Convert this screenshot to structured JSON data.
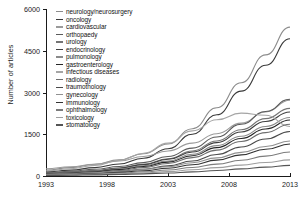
{
  "chart": {
    "type": "line",
    "title": "",
    "xlabel": "",
    "ylabel": "Number of articles",
    "xlim": [
      1993,
      2013
    ],
    "ylim": [
      0,
      6000
    ],
    "yticks": [
      0,
      1500,
      3000,
      4500,
      6000
    ],
    "ytick_labels": [
      "0",
      "1500",
      "3000",
      "4500",
      "6000"
    ],
    "xticks": [
      1993,
      1998,
      2003,
      2008,
      2013
    ],
    "xtick_labels": [
      "1993",
      "1998",
      "2003",
      "2008",
      "2013"
    ],
    "grid": false,
    "legend_position": "upper-left-inside"
  },
  "chart_data": {
    "type": "line",
    "title": "",
    "xlabel": "",
    "ylabel": "Number of articles",
    "xlim": [
      1993,
      2013
    ],
    "ylim": [
      0,
      6000
    ],
    "yticks": [
      0,
      1500,
      3000,
      4500,
      6000
    ],
    "xticks": [
      1993,
      1998,
      2003,
      2008,
      2013
    ],
    "grid": false,
    "legend_position": "upper-left-inside",
    "x": [
      1993,
      1995,
      1997,
      1999,
      2001,
      2003,
      2005,
      2007,
      2009,
      2011,
      2013
    ],
    "series": [
      {
        "name": "neurology/neurosurgery",
        "color": "#8c8c8c",
        "values": [
          210,
          300,
          420,
          580,
          800,
          1150,
          1700,
          2450,
          3350,
          4350,
          5350
        ]
      },
      {
        "name": "oncology",
        "color": "#3a3a3a",
        "values": [
          150,
          210,
          300,
          430,
          640,
          980,
          1500,
          2200,
          3050,
          3980,
          4930
        ]
      },
      {
        "name": "cardiovascular",
        "color": "#9a9a9a",
        "values": [
          260,
          330,
          420,
          540,
          700,
          900,
          1180,
          1520,
          1900,
          2300,
          2720
        ]
      },
      {
        "name": "orthopaedy",
        "color": "#5a5a5a",
        "values": [
          120,
          170,
          240,
          340,
          480,
          700,
          1000,
          1400,
          1860,
          2320,
          2760
        ]
      },
      {
        "name": "urology",
        "color": "#747474",
        "values": [
          100,
          140,
          200,
          290,
          420,
          620,
          900,
          1260,
          1660,
          2060,
          2430
        ]
      },
      {
        "name": "endocrinology",
        "color": "#404040",
        "values": [
          90,
          130,
          190,
          280,
          410,
          600,
          860,
          1200,
          1580,
          1960,
          2300
        ]
      },
      {
        "name": "pulmonology",
        "color": "#8a8a8a",
        "values": [
          80,
          120,
          175,
          255,
          370,
          540,
          780,
          1090,
          1430,
          1780,
          2100
        ]
      },
      {
        "name": "gastroenterology",
        "color": "#262626",
        "values": [
          70,
          105,
          155,
          230,
          340,
          500,
          730,
          1020,
          1350,
          1690,
          2010
        ]
      },
      {
        "name": "infectious diseases",
        "color": "#a5a5a5",
        "values": [
          180,
          260,
          380,
          560,
          820,
          1180,
          1620,
          2020,
          2260,
          2180,
          1780
        ]
      },
      {
        "name": "radiology",
        "color": "#6e6e6e",
        "values": [
          60,
          90,
          135,
          200,
          300,
          450,
          660,
          930,
          1240,
          1560,
          1860
        ]
      },
      {
        "name": "traumothology",
        "color": "#4a4a4a",
        "values": [
          50,
          75,
          110,
          165,
          245,
          365,
          540,
          770,
          1040,
          1330,
          1600
        ]
      },
      {
        "name": "gynecology",
        "color": "#909090",
        "values": [
          55,
          80,
          115,
          165,
          235,
          335,
          475,
          650,
          850,
          1060,
          1260
        ]
      },
      {
        "name": "immunology",
        "color": "#333333",
        "values": [
          40,
          60,
          88,
          130,
          190,
          280,
          405,
          570,
          760,
          960,
          1150
        ]
      },
      {
        "name": "ophthalmology",
        "color": "#7c7c7c",
        "values": [
          35,
          50,
          72,
          104,
          150,
          215,
          305,
          425,
          565,
          715,
          860
        ]
      },
      {
        "name": "toxicology",
        "color": "#9e9e9e",
        "values": [
          30,
          42,
          58,
          82,
          115,
          160,
          222,
          300,
          390,
          485,
          580
        ]
      },
      {
        "name": "stomatology",
        "color": "#555555",
        "values": [
          20,
          28,
          40,
          56,
          78,
          108,
          148,
          198,
          256,
          318,
          382
        ]
      }
    ]
  }
}
